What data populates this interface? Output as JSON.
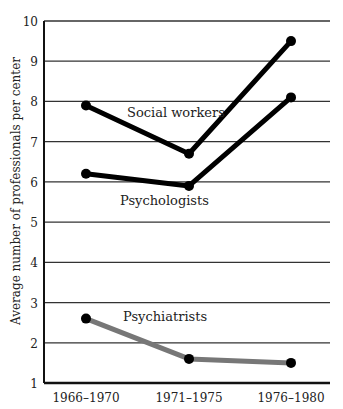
{
  "chart_data": {
    "type": "line",
    "title": "",
    "xlabel": "",
    "ylabel": "Average number of professionals per center",
    "categories": [
      "1966–1970",
      "1971–1975",
      "1976–1980"
    ],
    "ylim": [
      1,
      10
    ],
    "yticks": [
      1,
      2,
      3,
      4,
      5,
      6,
      7,
      8,
      9,
      10
    ],
    "grid": "horizontal",
    "legend": "inline labels",
    "series": [
      {
        "name": "Social workers",
        "values": [
          7.9,
          6.7,
          9.5
        ],
        "color": "#000000"
      },
      {
        "name": "Psychologists",
        "values": [
          6.2,
          5.9,
          8.1
        ],
        "color": "#000000"
      },
      {
        "name": "Psychiatrists",
        "values": [
          2.6,
          1.6,
          1.5
        ],
        "color": "#777777"
      }
    ]
  },
  "labels": {
    "social_workers": "Social workers",
    "psychologists": "Psychologists",
    "psychiatrists": "Psychiatrists",
    "ylabel": "Average number of professionals per center"
  }
}
